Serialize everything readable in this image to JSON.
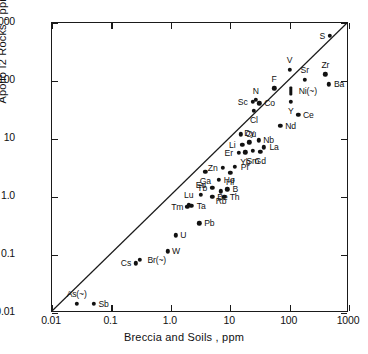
{
  "chart_data": {
    "type": "scatter",
    "title": "Apollo I2 Rocks vs Breccia and Soils",
    "subtitle": "Trace Elements",
    "xlabel": "Breccia and Soils , ppm",
    "ylabel": "Apollo I2 Rocks , ppm",
    "xscale": "log",
    "yscale": "log",
    "xlim": [
      0.01,
      1000
    ],
    "ylim": [
      0.01,
      1000
    ],
    "grid": false,
    "legend": "none",
    "xticks": [
      "0.01",
      "0.1",
      "1.0",
      "10",
      "100",
      "1000"
    ],
    "yticks": [
      "0.01",
      "0.1",
      "1.0",
      "10",
      "100",
      "1000"
    ],
    "xtick_values": [
      0.01,
      0.1,
      1.0,
      10,
      100,
      1000
    ],
    "ytick_values": [
      0.01,
      0.1,
      1.0,
      10,
      100,
      1000
    ],
    "annotations": [
      {
        "text": "1:1 reference line",
        "type": "line",
        "from": [
          0.01,
          0.01
        ],
        "to": [
          1000,
          1000
        ]
      }
    ],
    "points": [
      {
        "label": "S",
        "x": 480,
        "y": 600,
        "lp": "left"
      },
      {
        "label": "V",
        "x": 100,
        "y": 155,
        "lp": "top"
      },
      {
        "label": "Zr",
        "x": 400,
        "y": 130,
        "lp": "top"
      },
      {
        "label": "Sr",
        "x": 180,
        "y": 105,
        "lp": "top"
      },
      {
        "label": "Ba",
        "x": 460,
        "y": 88,
        "lp": "right"
      },
      {
        "label": "F",
        "x": 55,
        "y": 75,
        "lp": "top"
      },
      {
        "label": "Ni(~)",
        "x": 105,
        "y": 67,
        "lp": "right",
        "marker": "bar"
      },
      {
        "label": "N",
        "x": 27,
        "y": 47,
        "lp": "top"
      },
      {
        "label": "Sc",
        "x": 24,
        "y": 44,
        "lp": "left"
      },
      {
        "label": "Co",
        "x": 31,
        "y": 41,
        "lp": "right"
      },
      {
        "label": "Y",
        "x": 105,
        "y": 44,
        "lp": "bottom"
      },
      {
        "label": "Cl",
        "x": 25,
        "y": 31,
        "lp": "bottom"
      },
      {
        "label": "Ce",
        "x": 140,
        "y": 26,
        "lp": "right"
      },
      {
        "label": "Nd",
        "x": 70,
        "y": 17,
        "lp": "right"
      },
      {
        "label": "Cu",
        "x": 15,
        "y": 12,
        "lp": "right"
      },
      {
        "label": "Nb",
        "x": 30,
        "y": 9.5,
        "lp": "right"
      },
      {
        "label": "Dy",
        "x": 21,
        "y": 8.8,
        "lp": "top"
      },
      {
        "label": "Li",
        "x": 16,
        "y": 7.9,
        "lp": "left"
      },
      {
        "label": "La",
        "x": 37,
        "y": 7.2,
        "lp": "right"
      },
      {
        "label": "Sm",
        "x": 24,
        "y": 6.2,
        "lp": "bottom"
      },
      {
        "label": "Gd",
        "x": 32,
        "y": 6.0,
        "lp": "bottom"
      },
      {
        "label": "Yb",
        "x": 18,
        "y": 5.9,
        "lp": "bottom"
      },
      {
        "label": "Er",
        "x": 14,
        "y": 5.8,
        "lp": "left"
      },
      {
        "label": "Pr",
        "x": 12,
        "y": 3.3,
        "lp": "right"
      },
      {
        "label": "Zn",
        "x": 7.5,
        "y": 3.2,
        "lp": "left"
      },
      {
        "label": "Hf",
        "x": 10,
        "y": 2.6,
        "lp": "bottom"
      },
      {
        "label": "Ga",
        "x": 3.8,
        "y": 2.7,
        "lp": "bottom"
      },
      {
        "label": "Ho",
        "x": 6.5,
        "y": 2.0,
        "lp": "right"
      },
      {
        "label": "Tb",
        "x": 5.0,
        "y": 1.45,
        "lp": "left"
      },
      {
        "label": "B",
        "x": 9.0,
        "y": 1.35,
        "lp": "right"
      },
      {
        "label": "Rb",
        "x": 7.0,
        "y": 1.25,
        "lp": "bottom"
      },
      {
        "label": "Eu",
        "x": 3.2,
        "y": 1.1,
        "lp": "top"
      },
      {
        "label": "Be",
        "x": 5.0,
        "y": 1.0,
        "lp": "right"
      },
      {
        "label": "Th",
        "x": 8.0,
        "y": 1.0,
        "lp": "right"
      },
      {
        "label": "Ta",
        "x": 2.2,
        "y": 0.7,
        "lp": "right"
      },
      {
        "label": "Lu",
        "x": 2.0,
        "y": 0.74,
        "lp": "top"
      },
      {
        "label": "Tm",
        "x": 1.9,
        "y": 0.68,
        "lp": "left"
      },
      {
        "label": "Pb",
        "x": 3.0,
        "y": 0.35,
        "lp": "right"
      },
      {
        "label": "U",
        "x": 1.2,
        "y": 0.22,
        "lp": "right"
      },
      {
        "label": "W",
        "x": 0.9,
        "y": 0.115,
        "lp": "right"
      },
      {
        "label": "Br(~)",
        "x": 0.3,
        "y": 0.082,
        "lp": "right"
      },
      {
        "label": "Cs",
        "x": 0.26,
        "y": 0.072,
        "lp": "left"
      },
      {
        "label": "As(~)",
        "x": 0.026,
        "y": 0.0145,
        "lp": "top"
      },
      {
        "label": "Sb",
        "x": 0.05,
        "y": 0.0145,
        "lp": "right"
      }
    ]
  },
  "colors": {
    "axis": "#1a1a1a",
    "point": "#111111",
    "background": "#ffffff",
    "line": "#1a1a1a"
  }
}
